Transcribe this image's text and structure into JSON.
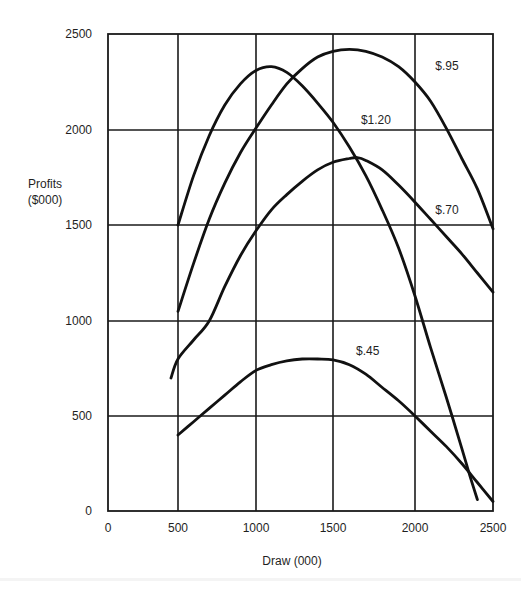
{
  "chart_data": {
    "type": "line",
    "title": "",
    "xlabel": "Draw (000)",
    "ylabel": "Profits ($000)",
    "ylabel_lines": [
      "Profits",
      "($000)"
    ],
    "xlim": [
      0,
      2500
    ],
    "ylim": [
      0,
      2500
    ],
    "x_ticks": [
      0,
      500,
      1000,
      1500,
      2000,
      2500
    ],
    "y_ticks": [
      0,
      500,
      1000,
      1500,
      2000,
      2500
    ],
    "x_tick_labels": [
      "0",
      "500",
      "1000",
      "1500",
      "2000",
      "2500"
    ],
    "y_tick_labels": [
      "0",
      "500",
      "1000",
      "1500",
      "2000",
      "2500"
    ],
    "grid": true,
    "legend": "inline labels next to curves",
    "series": [
      {
        "name": "$1.20",
        "label": "$1.20",
        "label_pos": [
          1670,
          2030
        ],
        "x": [
          500,
          600,
          700,
          800,
          900,
          1000,
          1100,
          1200,
          1300,
          1400,
          1500,
          1600,
          1700,
          1800,
          1900,
          2000,
          2100,
          2200,
          2300,
          2350,
          2400
        ],
        "y": [
          1500,
          1760,
          1970,
          2130,
          2240,
          2310,
          2330,
          2300,
          2230,
          2140,
          2040,
          1910,
          1760,
          1580,
          1380,
          1130,
          860,
          600,
          330,
          190,
          60
        ]
      },
      {
        "name": "$.95",
        "label": "$.95",
        "label_pos": [
          2130,
          2310
        ],
        "x": [
          500,
          600,
          700,
          800,
          900,
          1000,
          1100,
          1200,
          1300,
          1400,
          1500,
          1600,
          1700,
          1800,
          1900,
          2000,
          2100,
          2200,
          2300,
          2400,
          2500
        ],
        "y": [
          1050,
          1300,
          1530,
          1720,
          1880,
          2010,
          2130,
          2240,
          2320,
          2380,
          2410,
          2420,
          2410,
          2380,
          2330,
          2250,
          2150,
          2010,
          1850,
          1690,
          1480
        ]
      },
      {
        "name": "$.70",
        "label": "$.70",
        "label_pos": [
          2130,
          1560
        ],
        "x": [
          450,
          500,
          600,
          700,
          800,
          900,
          1000,
          1100,
          1200,
          1300,
          1400,
          1500,
          1600,
          1650,
          1700,
          1800,
          1900,
          2000,
          2100,
          2200,
          2300,
          2400,
          2500
        ],
        "y": [
          700,
          800,
          900,
          1000,
          1180,
          1340,
          1470,
          1580,
          1660,
          1730,
          1790,
          1830,
          1850,
          1855,
          1840,
          1790,
          1710,
          1620,
          1530,
          1440,
          1350,
          1250,
          1150
        ]
      },
      {
        "name": "$.45",
        "label": "$.45",
        "label_pos": [
          1640,
          820
        ],
        "x": [
          500,
          600,
          700,
          800,
          900,
          1000,
          1100,
          1200,
          1300,
          1400,
          1500,
          1600,
          1700,
          1800,
          1900,
          2000,
          2100,
          2200,
          2300,
          2400,
          2500
        ],
        "y": [
          400,
          470,
          540,
          610,
          680,
          740,
          770,
          790,
          800,
          800,
          795,
          770,
          720,
          650,
          580,
          500,
          420,
          340,
          250,
          150,
          50
        ]
      }
    ]
  },
  "colors": {
    "background": "#ffffff",
    "ink": "#111111"
  }
}
